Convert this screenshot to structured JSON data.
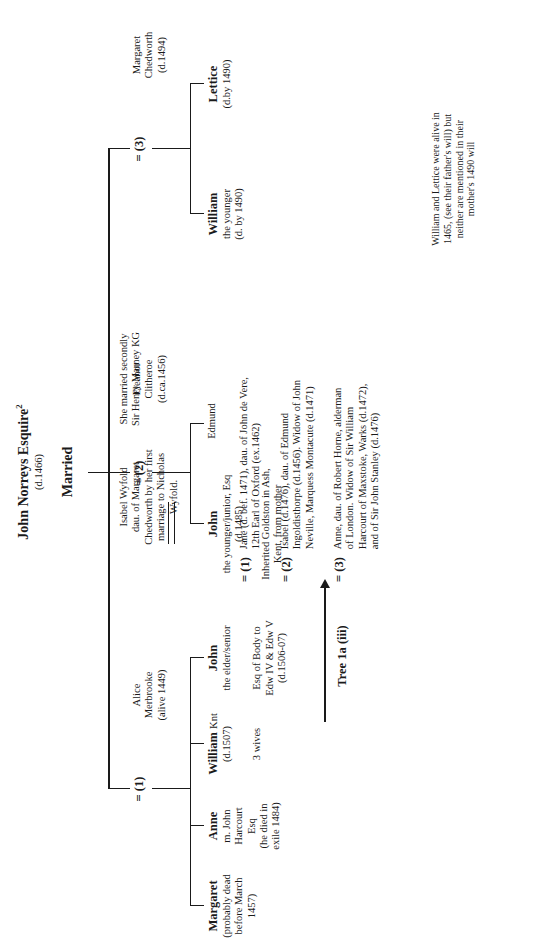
{
  "title": {
    "name": "John Norreys Esquire",
    "footnote_marker": "2",
    "death": "(d.1466)",
    "married_label": "Married"
  },
  "marriages": [
    {
      "key": "m1",
      "equals": "=",
      "ordinal": "(1)",
      "wife_lines": [
        "Alice",
        "Merbrooke",
        "(alive 1449)"
      ]
    },
    {
      "key": "m2",
      "equals": "=",
      "ordinal": "(2)",
      "wife_lines": [
        "Eleanor",
        "Clitheroe",
        "(d.ca.1456)"
      ]
    },
    {
      "key": "m3",
      "equals": "=",
      "ordinal": "(3)",
      "wife_lines": [
        "Margaret",
        "Chedworth",
        "(d.1494)"
      ]
    }
  ],
  "children": {
    "margaret": {
      "name": "Margaret",
      "detail_lines": [
        "(probably dead",
        "before March",
        "1457)"
      ]
    },
    "anne": {
      "name": "Anne",
      "detail_lines": [
        "m. John",
        "Harcourt",
        "Esq",
        "(he died in",
        "exile 1484)"
      ]
    },
    "william_knt": {
      "name": "William",
      "name_suffix": "Knt",
      "detail_lines": [
        "(d.1507)"
      ],
      "wives_label": "3 wives"
    },
    "john_elder": {
      "name": "John",
      "detail_lines": [
        "the elder/senior"
      ],
      "extra_lines": [
        "Esq of Body to",
        "Edw IV & Edw V",
        "(d.1506-07)"
      ]
    },
    "john_younger": {
      "name": "John",
      "detail_lines": [
        "the younger/junior, Esq",
        "(d.1485)"
      ],
      "extra_lines": [
        "Inherited Goldston in Ash,",
        "Kent, from mother"
      ]
    },
    "edmund": {
      "name": "Edmund"
    },
    "william_younger": {
      "name": "William",
      "detail_lines": [
        "the younger",
        "(d. by 1490)"
      ]
    },
    "lettice": {
      "name": "Lettice",
      "detail_lines": [
        "(d.by 1490)"
      ]
    }
  },
  "spouse_notes": {
    "isabel_wyfold": {
      "equals": "=",
      "lines": [
        "Isabel Wyfold",
        "dau. of Margaret",
        "Chedworth by her first",
        "marriage to Nicholas",
        "Wyfold."
      ],
      "second_marriage": [
        "She married secondly",
        "Sir Henry Marney KG"
      ]
    }
  },
  "three_wives": [
    {
      "equals": "=",
      "ordinal": "(1)",
      "lines": [
        "Jane (d. bef. 1471), dau. of John de Vere,",
        "12th Earl of Oxford (ex.1462)"
      ]
    },
    {
      "equals": "=",
      "ordinal": "(2)",
      "lines": [
        "Isabel (d.1476), dau. of Edmund",
        "Ingoldisthorpe (d.1456).  Widow of John",
        "Neville, Marquess Montacute (d.1471)"
      ]
    },
    {
      "equals": "=",
      "ordinal": "(3)",
      "lines": [
        "Anne, dau. of Robert Horne, alderman",
        "of London.  Widow of Sir William",
        "Harcourt of Maxstoke, Warks (d.1472),",
        "and of Sir John Stanley (d.1476)"
      ]
    }
  ],
  "tree_ref": "Tree 1a (iii)",
  "footnote": {
    "lines": [
      "William and Lettice were alive in",
      "1465, (see their father's will) but",
      "neither are mentioned in their",
      "mother's 1490 will"
    ]
  }
}
